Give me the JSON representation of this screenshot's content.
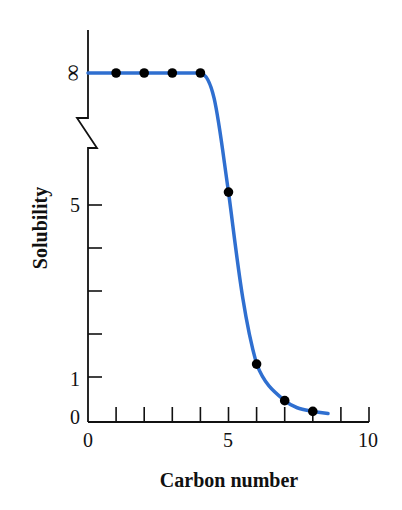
{
  "chart_data": {
    "type": "line",
    "title": "",
    "xlabel": "Carbon number",
    "ylabel": "Solubility",
    "xlim": [
      0,
      10
    ],
    "ylim": [
      0,
      "∞"
    ],
    "x_ticks": [
      0,
      1,
      2,
      3,
      4,
      5,
      6,
      7,
      8,
      9,
      10
    ],
    "x_tick_labels": [
      {
        "value": 0,
        "label": "0"
      },
      {
        "value": 5,
        "label": "5"
      },
      {
        "value": 10,
        "label": "10"
      }
    ],
    "y_ticks": [
      0,
      1,
      2,
      3,
      4,
      5
    ],
    "y_tick_labels": [
      {
        "value": 0,
        "label": "0"
      },
      {
        "value": 1,
        "label": "1"
      },
      {
        "value": 5,
        "label": "5"
      },
      {
        "value": "infinity",
        "label": "∞"
      }
    ],
    "axis_break": "y-axis broken between 5 and ∞",
    "grid": false,
    "legend": null,
    "series": [
      {
        "name": "Solubility vs carbon number",
        "color": "#2f6fd0",
        "marker_color": "#000000",
        "points": [
          {
            "x": 1,
            "y": "∞"
          },
          {
            "x": 2,
            "y": "∞"
          },
          {
            "x": 3,
            "y": "∞"
          },
          {
            "x": 4,
            "y": "∞"
          },
          {
            "x": 5,
            "y": 5.3
          },
          {
            "x": 6,
            "y": 1.3
          },
          {
            "x": 7,
            "y": 0.45
          },
          {
            "x": 8,
            "y": 0.2
          }
        ]
      }
    ]
  },
  "labels": {
    "ylabel": "Solubility",
    "xlabel": "Carbon number",
    "x0": "0",
    "x5": "5",
    "x10": "10",
    "y0": "0",
    "y1": "1",
    "y5": "5",
    "yinf": "∞"
  }
}
